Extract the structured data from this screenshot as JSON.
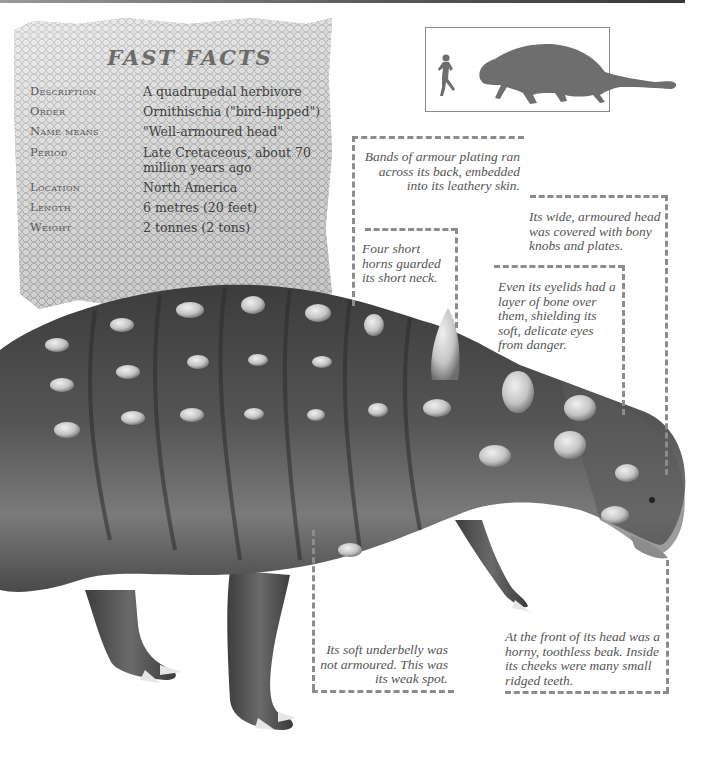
{
  "fast_facts": {
    "title": "FAST FACTS",
    "rows": [
      {
        "label": "Description",
        "value": "A quadrupedal herbivore"
      },
      {
        "label": "Order",
        "value": "Ornithischia (\"bird-hipped\")"
      },
      {
        "label": "Name means",
        "value": "\"Well-armoured head\""
      },
      {
        "label": "Period",
        "value": "Late Cretaceous, about 70 million years ago"
      },
      {
        "label": "Location",
        "value": "North America"
      },
      {
        "label": "Length",
        "value": "6 metres (20 feet)"
      },
      {
        "label": "Weight",
        "value": "2 tonnes (2 tons)"
      }
    ]
  },
  "scale_comparison": {
    "icons": [
      "human-silhouette-icon",
      "ankylosaur-silhouette-icon"
    ],
    "silhouette_color": "#6e6e6e"
  },
  "callouts": {
    "armour_bands": "Bands of armour plating ran across its back, embedded into its leathery skin.",
    "head_armour": "Its wide, armoured head was covered with bony knobs and plates.",
    "neck_horns": "Four short horns guarded its short neck.",
    "eyelids": "Even its eyelids had a layer of bone over them, shielding its soft, delicate eyes from danger.",
    "underbelly": "Its soft underbelly was not armoured. This was its weak spot.",
    "beak": "At the front of its head was a horny, toothless beak. Inside its cheeks were many small ridged teeth."
  },
  "colors": {
    "leader_line": "#8c8c8c",
    "callout_text": "#555555",
    "title_text": "#6b6b6b"
  }
}
